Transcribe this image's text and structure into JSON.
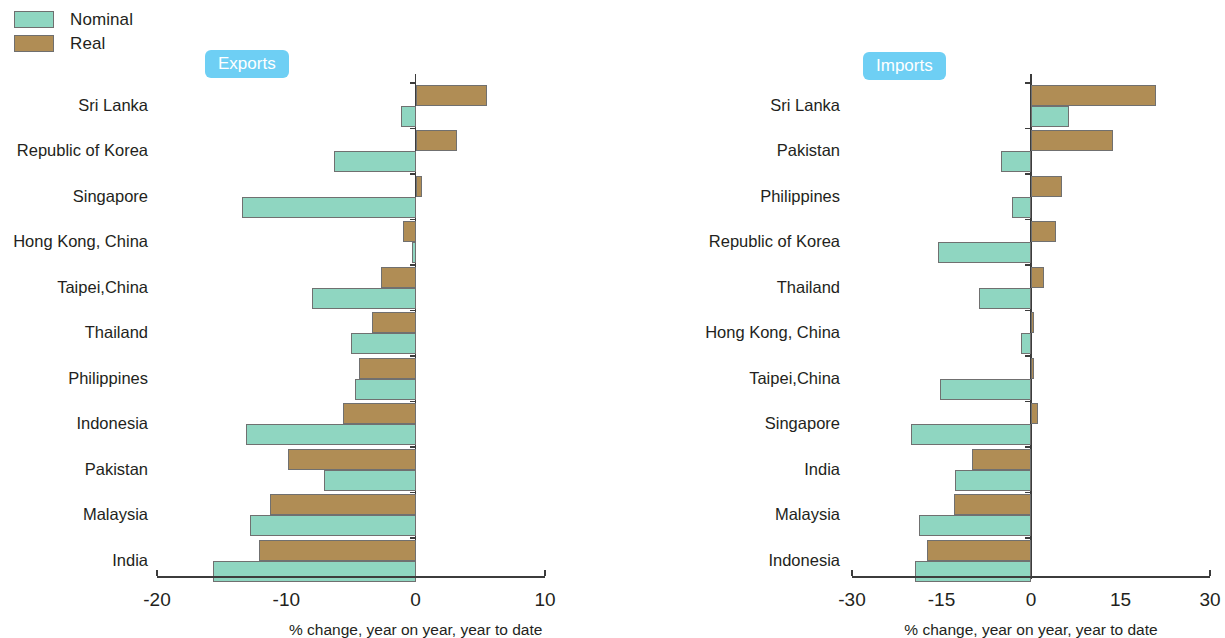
{
  "legend": {
    "items": [
      {
        "label": "Nominal",
        "color": "#8fd6c1"
      },
      {
        "label": "Real",
        "color": "#b08d55"
      }
    ]
  },
  "panels": {
    "exports": {
      "badge": "Exports",
      "xlabel": "% change, year on year, year to date"
    },
    "imports": {
      "badge": "Imports",
      "xlabel": "% change, year on year, year to date"
    }
  },
  "chart_data": [
    {
      "type": "bar",
      "orientation": "horizontal",
      "title": "Exports",
      "xlabel": "% change, year on year, year to date",
      "ylabel": "",
      "xlim": [
        -20,
        10
      ],
      "xticks": [
        -20,
        -10,
        0,
        10
      ],
      "xtick_labels": [
        "-20",
        "-10",
        "0",
        "10"
      ],
      "grid": false,
      "legend_position": "top-left",
      "categories": [
        "Sri Lanka",
        "Republic of Korea",
        "Singapore",
        "Hong Kong, China",
        "Taipei,China",
        "Thailand",
        "Philippines",
        "Indonesia",
        "Pakistan",
        "Malaysia",
        "India"
      ],
      "series": [
        {
          "name": "Nominal",
          "color": "#8fd6c1",
          "values": [
            -1.1,
            -6.3,
            -13.4,
            -0.3,
            -8.0,
            -5.0,
            -4.7,
            -13.1,
            -7.1,
            -12.8,
            -15.7
          ]
        },
        {
          "name": "Real",
          "color": "#b08d55",
          "values": [
            5.5,
            3.2,
            0.5,
            -1.0,
            -2.7,
            -3.4,
            -4.4,
            -5.6,
            -9.9,
            -11.3,
            -12.1
          ]
        }
      ]
    },
    {
      "type": "bar",
      "orientation": "horizontal",
      "title": "Imports",
      "xlabel": "% change, year on year, year to date",
      "ylabel": "",
      "xlim": [
        -30,
        30
      ],
      "xticks": [
        -30,
        -15,
        0,
        15,
        30
      ],
      "xtick_labels": [
        "-30",
        "-15",
        "0",
        "15",
        "30"
      ],
      "grid": false,
      "legend_position": "top-left",
      "categories": [
        "Sri Lanka",
        "Pakistan",
        "Philippines",
        "Republic of Korea",
        "Thailand",
        "Hong Kong, China",
        "Taipei,China",
        "Singapore",
        "India",
        "Malaysia",
        "Indonesia"
      ],
      "series": [
        {
          "name": "Nominal",
          "color": "#8fd6c1",
          "values": [
            6.3,
            -5.0,
            -3.2,
            -15.6,
            -8.7,
            -1.7,
            -15.3,
            -20.1,
            -12.7,
            -18.8,
            -19.4
          ]
        },
        {
          "name": "Real",
          "color": "#b08d55",
          "values": [
            21.0,
            13.7,
            5.2,
            4.2,
            2.2,
            0.5,
            0.5,
            1.2,
            -9.9,
            -12.9,
            -17.4
          ]
        }
      ]
    }
  ]
}
